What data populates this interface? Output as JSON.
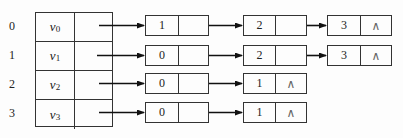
{
  "diagram": {
    "type": "adjacency-list",
    "null_symbol": "∧",
    "vertices": [
      {
        "index": "0",
        "name": "v",
        "sub": "0",
        "adjacent": [
          "1",
          "2",
          "3"
        ]
      },
      {
        "index": "1",
        "name": "v",
        "sub": "1",
        "adjacent": [
          "0",
          "2",
          "3"
        ]
      },
      {
        "index": "2",
        "name": "v",
        "sub": "2",
        "adjacent": [
          "0",
          "1"
        ]
      },
      {
        "index": "3",
        "name": "v",
        "sub": "3",
        "adjacent": [
          "0",
          "1"
        ]
      }
    ]
  },
  "labels": {
    "idx0": "0",
    "idx1": "1",
    "idx2": "2",
    "idx3": "3",
    "v0": "v",
    "v0sub": "0",
    "v1": "v",
    "v1sub": "1",
    "v2": "v",
    "v2sub": "2",
    "v3": "v",
    "v3sub": "3",
    "r0n0": "1",
    "r0n1": "2",
    "r0n2": "3",
    "r1n0": "0",
    "r1n1": "2",
    "r1n2": "3",
    "r2n0": "0",
    "r2n1": "1",
    "r3n0": "0",
    "r3n1": "1",
    "null": "∧"
  }
}
